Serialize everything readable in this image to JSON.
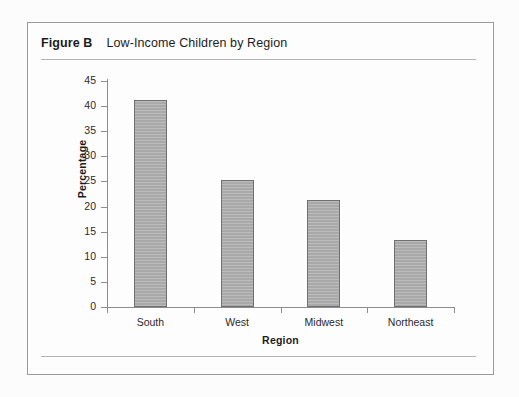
{
  "figure": {
    "label": "Figure B",
    "title": "Low-Income Children by Region"
  },
  "colors": {
    "bar_fill": "#a9a9a9",
    "bar_border": "#6f6f6f",
    "axis": "#8d8d8d",
    "rule": "#b4b4b4",
    "frame": "#9a9a9a",
    "background": "#fcfcfc",
    "text": "#1c1c1c"
  },
  "chart_data": {
    "type": "bar",
    "title": "Low-Income Children by Region",
    "categories": [
      "South",
      "West",
      "Midwest",
      "Northeast"
    ],
    "values": [
      41.3,
      25.3,
      21.4,
      13.3
    ],
    "xlabel": "Region",
    "ylabel": "Percentage",
    "ylim": [
      0,
      45
    ],
    "ytick_step": 5,
    "yticks": [
      0,
      5,
      10,
      15,
      20,
      25,
      30,
      35,
      40,
      45
    ],
    "ytick_labels": [
      "0",
      "5",
      "10",
      "15",
      "20",
      "25",
      "30",
      "35",
      "40",
      "45"
    ],
    "grid": false,
    "legend": null,
    "legend_position": "none"
  }
}
